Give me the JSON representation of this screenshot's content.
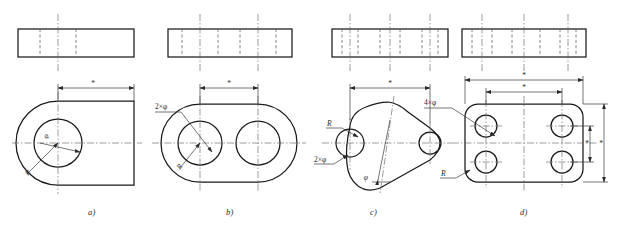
{
  "figure": {
    "stroke_color": "#1a1a1a",
    "thin_color": "#3a3a3a",
    "center_color": "#555555",
    "hidden_color": "#6b6b6b",
    "background": "#ffffff"
  },
  "parts": [
    {
      "id": "a",
      "caption": "a)",
      "front_view": {
        "hidden_line_count": 2,
        "center_line_count": 1
      },
      "top_view": {
        "shape": "round-end-plate-single-hole",
        "hole_count": 1
      },
      "dimension_labels": [
        "*"
      ],
      "annotations": [
        {
          "name": "diameter",
          "text": "φ"
        },
        {
          "name": "radius",
          "text": "R"
        }
      ]
    },
    {
      "id": "b",
      "caption": "b)",
      "front_view": {
        "hidden_line_count": 4,
        "center_line_count": 2
      },
      "top_view": {
        "shape": "obround-two-holes",
        "hole_count": 2
      },
      "dimension_labels": [
        "*"
      ],
      "annotations": [
        {
          "name": "hole-diameter",
          "text": "2×φ"
        },
        {
          "name": "radius",
          "text": "R"
        }
      ]
    },
    {
      "id": "c",
      "caption": "c)",
      "front_view": {
        "hidden_line_count": 6,
        "center_line_count": 3
      },
      "top_view": {
        "shape": "triangular-lens-plate",
        "hole_count": 3
      },
      "dimension_labels": [
        "*"
      ],
      "annotations": [
        {
          "name": "radius",
          "text": "R"
        },
        {
          "name": "hole-diameter",
          "text": "2×φ"
        },
        {
          "name": "diameter",
          "text": "φ"
        }
      ]
    },
    {
      "id": "d",
      "caption": "d)",
      "front_view": {
        "hidden_line_count": 6,
        "center_line_count": 3
      },
      "top_view": {
        "shape": "rounded-rectangle-four-holes",
        "hole_count": 4
      },
      "dimension_labels": [
        "*",
        "*",
        "*",
        "*"
      ],
      "annotations": [
        {
          "name": "hole-diameter",
          "text": "4×φ"
        },
        {
          "name": "radius",
          "text": "R"
        }
      ]
    }
  ]
}
